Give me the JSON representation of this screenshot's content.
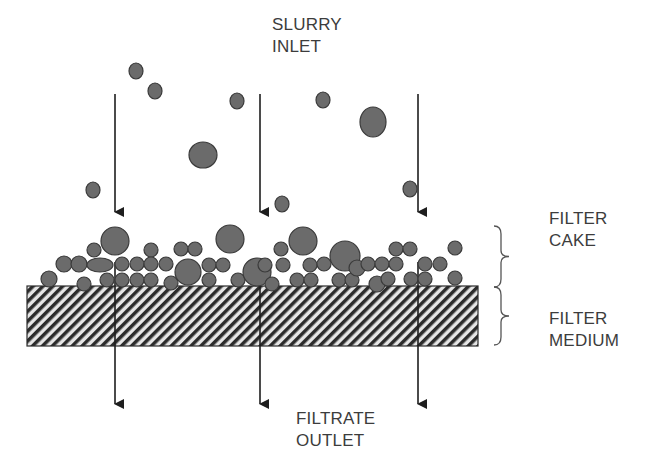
{
  "diagram": {
    "colors": {
      "particle_fill": "#6b6b6b",
      "particle_stroke": "#3a3a3a",
      "arrow": "#1e1e1e",
      "hatch_dark": "#2b2b2b",
      "hatch_light": "#e6e6e6",
      "text": "#3c3c3c",
      "brace": "#555555"
    },
    "labels": {
      "slurry_inlet": {
        "line1": "SLURRY",
        "line2": "INLET",
        "x": 272,
        "y": 14
      },
      "filter_cake": {
        "line1": "FILTER",
        "line2": "CAKE",
        "x": 549,
        "y": 208
      },
      "filter_medium": {
        "line1": "FILTER",
        "line2": "MEDIUM",
        "x": 549,
        "y": 308
      },
      "filtrate_outlet": {
        "line1": "FILTRATE",
        "line2": "OUTLET",
        "x": 296,
        "y": 408
      }
    },
    "filter_medium": {
      "x": 27,
      "y": 286,
      "width": 451,
      "height": 60
    },
    "inlet_arrows": [
      {
        "x": 115,
        "y1": 94,
        "y2": 212
      },
      {
        "x": 260,
        "y1": 94,
        "y2": 212
      },
      {
        "x": 418,
        "y1": 94,
        "y2": 212
      }
    ],
    "outlet_arrows": [
      {
        "x": 115,
        "y1": 262,
        "y2": 404
      },
      {
        "x": 260,
        "y1": 262,
        "y2": 404
      },
      {
        "x": 418,
        "y1": 262,
        "y2": 404
      }
    ],
    "braces": [
      {
        "name": "cake-brace",
        "x": 494,
        "y1": 226,
        "y2": 287
      },
      {
        "name": "medium-brace",
        "x": 494,
        "y1": 287,
        "y2": 345
      }
    ],
    "suspended_particles": [
      {
        "cx": 136,
        "cy": 71,
        "rx": 7,
        "ry": 8
      },
      {
        "cx": 155,
        "cy": 91,
        "rx": 7,
        "ry": 8
      },
      {
        "cx": 237,
        "cy": 101,
        "rx": 7,
        "ry": 8
      },
      {
        "cx": 323,
        "cy": 100,
        "rx": 7,
        "ry": 8
      },
      {
        "cx": 373,
        "cy": 122,
        "rx": 13,
        "ry": 15
      },
      {
        "cx": 203,
        "cy": 155,
        "rx": 14,
        "ry": 13
      },
      {
        "cx": 93,
        "cy": 190,
        "rx": 7,
        "ry": 8
      },
      {
        "cx": 282,
        "cy": 204,
        "rx": 7,
        "ry": 8
      },
      {
        "cx": 410,
        "cy": 189,
        "rx": 7,
        "ry": 8
      }
    ],
    "cake_particles": [
      {
        "cx": 49,
        "cy": 279,
        "rx": 8,
        "ry": 8
      },
      {
        "cx": 84,
        "cy": 284,
        "rx": 7,
        "ry": 7
      },
      {
        "cx": 64,
        "cy": 264,
        "rx": 8,
        "ry": 8
      },
      {
        "cx": 79,
        "cy": 264,
        "rx": 8,
        "ry": 8
      },
      {
        "cx": 94,
        "cy": 250,
        "rx": 7,
        "ry": 7
      },
      {
        "cx": 100,
        "cy": 265,
        "rx": 13,
        "ry": 7
      },
      {
        "cx": 115,
        "cy": 241,
        "rx": 14,
        "ry": 14
      },
      {
        "cx": 107,
        "cy": 280,
        "rx": 7,
        "ry": 7
      },
      {
        "cx": 122,
        "cy": 264,
        "rx": 7,
        "ry": 7
      },
      {
        "cx": 122,
        "cy": 280,
        "rx": 7,
        "ry": 7
      },
      {
        "cx": 137,
        "cy": 264,
        "rx": 7,
        "ry": 7
      },
      {
        "cx": 137,
        "cy": 280,
        "rx": 7,
        "ry": 7
      },
      {
        "cx": 151,
        "cy": 250,
        "rx": 7,
        "ry": 7
      },
      {
        "cx": 151,
        "cy": 264,
        "rx": 7,
        "ry": 7
      },
      {
        "cx": 151,
        "cy": 280,
        "rx": 7,
        "ry": 7
      },
      {
        "cx": 166,
        "cy": 264,
        "rx": 7,
        "ry": 7
      },
      {
        "cx": 171,
        "cy": 283,
        "rx": 7,
        "ry": 7
      },
      {
        "cx": 181,
        "cy": 249,
        "rx": 7,
        "ry": 7
      },
      {
        "cx": 195,
        "cy": 249,
        "rx": 7,
        "ry": 7
      },
      {
        "cx": 188,
        "cy": 272,
        "rx": 13,
        "ry": 13
      },
      {
        "cx": 209,
        "cy": 265,
        "rx": 7,
        "ry": 7
      },
      {
        "cx": 209,
        "cy": 280,
        "rx": 7,
        "ry": 7
      },
      {
        "cx": 223,
        "cy": 265,
        "rx": 7,
        "ry": 7
      },
      {
        "cx": 230,
        "cy": 239,
        "rx": 14,
        "ry": 14
      },
      {
        "cx": 238,
        "cy": 280,
        "rx": 7,
        "ry": 7
      },
      {
        "cx": 257,
        "cy": 272,
        "rx": 14,
        "ry": 14
      },
      {
        "cx": 265,
        "cy": 265,
        "rx": 7,
        "ry": 7
      },
      {
        "cx": 272,
        "cy": 284,
        "rx": 7,
        "ry": 7
      },
      {
        "cx": 281,
        "cy": 249,
        "rx": 7,
        "ry": 7
      },
      {
        "cx": 283,
        "cy": 265,
        "rx": 7,
        "ry": 7
      },
      {
        "cx": 297,
        "cy": 280,
        "rx": 7,
        "ry": 7
      },
      {
        "cx": 303,
        "cy": 241,
        "rx": 14,
        "ry": 14
      },
      {
        "cx": 310,
        "cy": 265,
        "rx": 7,
        "ry": 7
      },
      {
        "cx": 311,
        "cy": 280,
        "rx": 7,
        "ry": 7
      },
      {
        "cx": 324,
        "cy": 264,
        "rx": 7,
        "ry": 7
      },
      {
        "cx": 345,
        "cy": 256,
        "rx": 15,
        "ry": 15
      },
      {
        "cx": 339,
        "cy": 280,
        "rx": 7,
        "ry": 7
      },
      {
        "cx": 352,
        "cy": 280,
        "rx": 7,
        "ry": 7
      },
      {
        "cx": 357,
        "cy": 268,
        "rx": 8,
        "ry": 8
      },
      {
        "cx": 368,
        "cy": 264,
        "rx": 7,
        "ry": 7
      },
      {
        "cx": 377,
        "cy": 284,
        "rx": 8,
        "ry": 8
      },
      {
        "cx": 382,
        "cy": 264,
        "rx": 7,
        "ry": 7
      },
      {
        "cx": 388,
        "cy": 279,
        "rx": 7,
        "ry": 7
      },
      {
        "cx": 396,
        "cy": 264,
        "rx": 7,
        "ry": 7
      },
      {
        "cx": 396,
        "cy": 249,
        "rx": 7,
        "ry": 7
      },
      {
        "cx": 410,
        "cy": 249,
        "rx": 7,
        "ry": 7
      },
      {
        "cx": 411,
        "cy": 279,
        "rx": 7,
        "ry": 7
      },
      {
        "cx": 425,
        "cy": 264,
        "rx": 7,
        "ry": 7
      },
      {
        "cx": 425,
        "cy": 279,
        "rx": 7,
        "ry": 7
      },
      {
        "cx": 440,
        "cy": 264,
        "rx": 7,
        "ry": 7
      },
      {
        "cx": 455,
        "cy": 248,
        "rx": 7,
        "ry": 7
      },
      {
        "cx": 455,
        "cy": 278,
        "rx": 7,
        "ry": 7
      }
    ]
  }
}
